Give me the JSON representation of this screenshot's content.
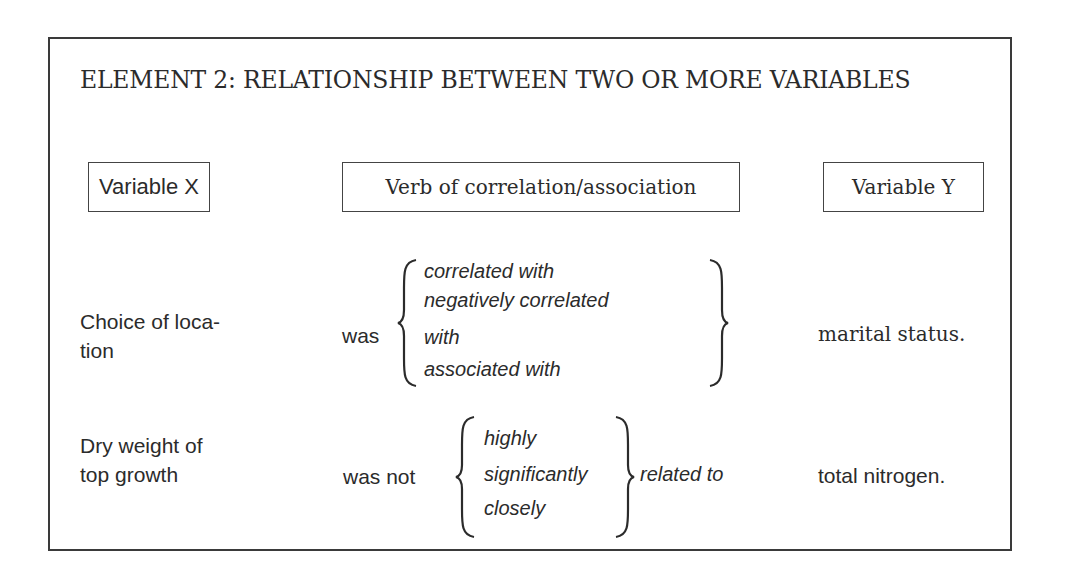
{
  "title": "ELEMENT 2: RELATIONSHIP BETWEEN TWO OR MORE VARIABLES",
  "headers": {
    "variable_x": "Variable X",
    "verb": "Verb of correlation/association",
    "variable_y": "Variable Y"
  },
  "examples": [
    {
      "variable_x": [
        "Choice of loca-",
        "tion"
      ],
      "verb_prefix": "was",
      "options": [
        "correlated with",
        "negatively correlated",
        "with",
        "associated with"
      ],
      "verb_suffix": "",
      "variable_y": "marital status."
    },
    {
      "variable_x": [
        "Dry weight of",
        "top growth"
      ],
      "verb_prefix": "was not",
      "options": [
        "highly",
        "significantly",
        "closely"
      ],
      "verb_suffix": "related to",
      "variable_y": "total nitrogen."
    }
  ]
}
